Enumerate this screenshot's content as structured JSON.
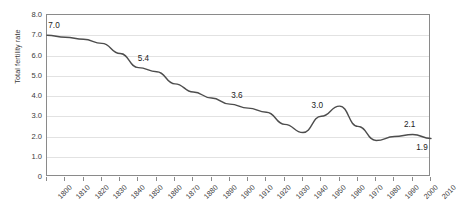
{
  "chart_data": {
    "type": "line",
    "title": "",
    "xlabel": "",
    "ylabel": "Total fertility rate",
    "ylim": [
      0,
      8
    ],
    "xlim": [
      1800,
      2010
    ],
    "ytick_labels": [
      "8.0",
      "7.0",
      "6.0",
      "5.0",
      "4.0",
      "3.0",
      "2.0",
      "1.0",
      "0"
    ],
    "ytick_values": [
      8,
      7,
      6,
      5,
      4,
      3,
      2,
      1,
      0
    ],
    "grid": true,
    "legend": "none",
    "categories": [
      1800,
      1810,
      1820,
      1830,
      1840,
      1850,
      1860,
      1870,
      1880,
      1890,
      1900,
      1910,
      1920,
      1930,
      1940,
      1950,
      1960,
      1970,
      1980,
      1990,
      2000,
      2010
    ],
    "xtick_labels": [
      "1800",
      "1810",
      "1820",
      "1830",
      "1840",
      "1850",
      "1860",
      "1870",
      "1880",
      "1890",
      "1900",
      "1910",
      "1920",
      "1930",
      "1940",
      "1950",
      "1960",
      "1970",
      "1980",
      "1990",
      "2000",
      "2010"
    ],
    "values": [
      7.0,
      6.9,
      6.8,
      6.6,
      6.1,
      5.4,
      5.2,
      4.6,
      4.2,
      3.9,
      3.6,
      3.4,
      3.2,
      2.6,
      2.2,
      3.0,
      3.5,
      2.5,
      1.8,
      2.0,
      2.1,
      1.9
    ],
    "series": [
      {
        "name": "Total fertility rate",
        "color": "#4d4d4d",
        "values": [
          7.0,
          6.9,
          6.8,
          6.6,
          6.1,
          5.4,
          5.2,
          4.6,
          4.2,
          3.9,
          3.6,
          3.4,
          3.2,
          2.6,
          2.2,
          3.0,
          3.5,
          2.5,
          1.8,
          2.0,
          2.1,
          1.9
        ]
      }
    ],
    "annotations": [
      {
        "text": "7.0",
        "x": 1800,
        "y": 7.0,
        "dx": 8,
        "dy": -9
      },
      {
        "text": "5.4",
        "x": 1850,
        "y": 5.4,
        "dx": 6,
        "dy": -9
      },
      {
        "text": "3.6",
        "x": 1900,
        "y": 3.6,
        "dx": 8,
        "dy": -8
      },
      {
        "text": "3.0",
        "x": 1950,
        "y": 3.0,
        "dx": -3,
        "dy": -10
      },
      {
        "text": "2.1",
        "x": 2000,
        "y": 2.1,
        "dx": -2,
        "dy": -9
      },
      {
        "text": "1.9",
        "x": 2010,
        "y": 1.9,
        "dx": -8,
        "dy": 9
      }
    ],
    "colors": {
      "line": "#4d4d4d",
      "grid": "#e2e2e2",
      "border": "#8a8a8a",
      "text": "#3a3a3a",
      "background": "#ffffff"
    }
  }
}
